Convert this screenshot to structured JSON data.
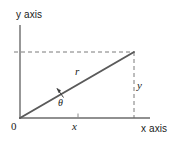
{
  "figure": {
    "axes": {
      "y_axis_label": "y axis",
      "x_axis_label": "x axis",
      "origin_label": "0"
    },
    "labels": {
      "radius": "r",
      "angle": "θ",
      "x_component": "x",
      "y_component": "y"
    },
    "colors": {
      "background": "#ffffff",
      "axis": "#6b6b6b",
      "ray": "#5a5a5a",
      "dashed": "#7a7a7a",
      "text": "#1a1a1a"
    },
    "geometry": {
      "origin": [
        20,
        118
      ],
      "point": [
        134,
        52
      ],
      "y_axis_top": [
        20,
        25
      ],
      "x_axis_right": [
        150,
        118
      ],
      "x_tick": [
        78,
        118
      ],
      "y_tick": [
        14,
        52
      ]
    }
  }
}
